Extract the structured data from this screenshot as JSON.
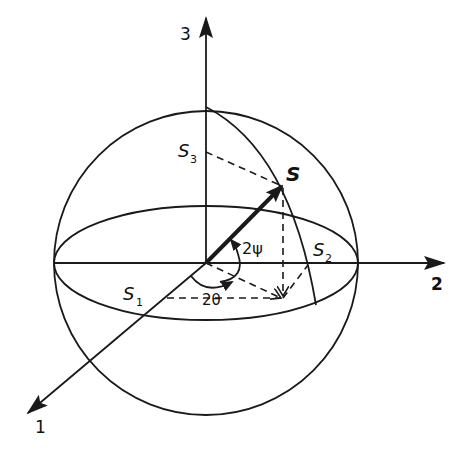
{
  "diagram": {
    "axes": [
      {
        "id": "axis-1",
        "label": "1"
      },
      {
        "id": "axis-2",
        "label": "2"
      },
      {
        "id": "axis-3",
        "label": "3"
      }
    ],
    "point": {
      "label": "S"
    },
    "components": [
      {
        "label": "S",
        "sub": "1"
      },
      {
        "label": "S",
        "sub": "2"
      },
      {
        "label": "S",
        "sub": "3"
      }
    ],
    "angles": [
      {
        "label": "2ψ"
      },
      {
        "label": "2θ"
      }
    ],
    "colors": {
      "ink": "#1a1a1a",
      "background": "#ffffff"
    }
  }
}
